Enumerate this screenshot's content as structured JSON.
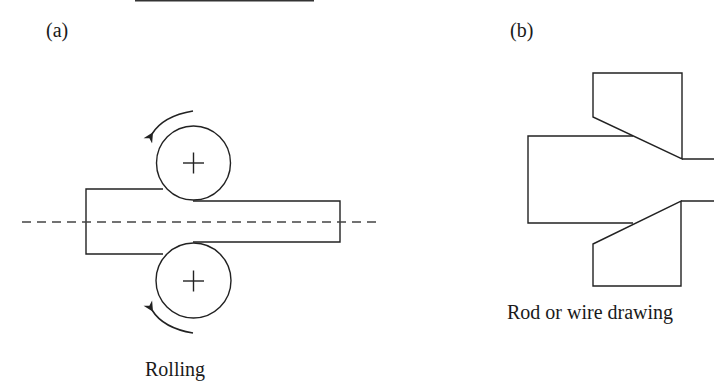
{
  "panels": [
    {
      "id": "a",
      "label": "(a)",
      "caption": "Rolling"
    },
    {
      "id": "b",
      "label": "(b)",
      "caption": "Rod or wire drawing"
    }
  ],
  "colors": {
    "stroke": "#222222",
    "centerline": "#444444",
    "background": "#ffffff"
  }
}
